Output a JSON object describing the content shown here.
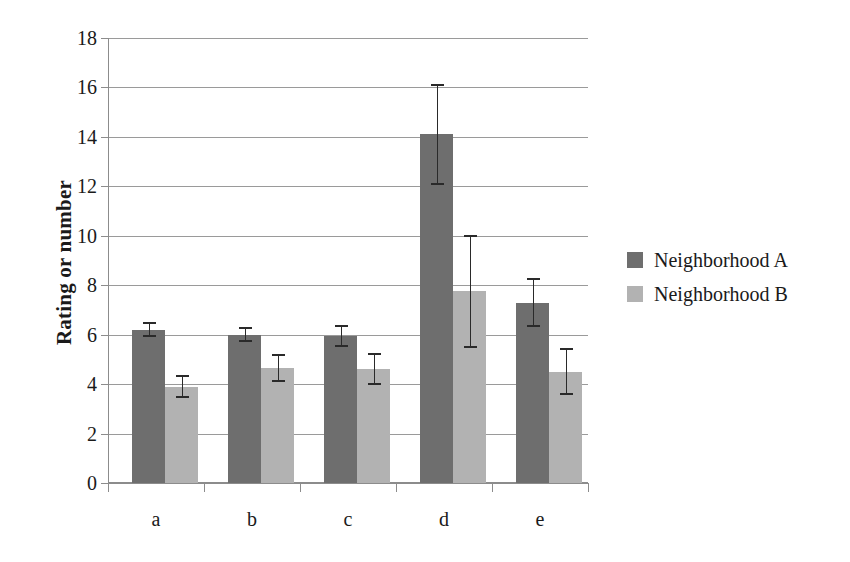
{
  "chart_data": {
    "type": "bar",
    "title": "",
    "xlabel": "",
    "ylabel": "Rating or number",
    "categories": [
      "a",
      "b",
      "c",
      "d",
      "e"
    ],
    "ylim": [
      0,
      18
    ],
    "yticks": [
      0,
      2,
      4,
      6,
      8,
      10,
      12,
      14,
      16,
      18
    ],
    "grid": true,
    "legend_position": "right",
    "errorbars": true,
    "series": [
      {
        "name": "Neighborhood A",
        "color": "#6e6e6e",
        "values": [
          6.2,
          6.0,
          5.95,
          14.1,
          7.3
        ],
        "errors": [
          0.3,
          0.3,
          0.45,
          2.05,
          1.0
        ]
      },
      {
        "name": "Neighborhood B",
        "color": "#b2b2b2",
        "values": [
          3.9,
          4.65,
          4.6,
          7.75,
          4.5
        ],
        "errors": [
          0.45,
          0.55,
          0.65,
          2.3,
          0.95
        ]
      }
    ]
  },
  "axis": {
    "y_title": "Rating or number",
    "y_tick_labels": [
      "0",
      "2",
      "4",
      "6",
      "8",
      "10",
      "12",
      "14",
      "16",
      "18"
    ],
    "x_tick_labels": [
      "a",
      "b",
      "c",
      "d",
      "e"
    ]
  },
  "legend": {
    "entries": [
      {
        "label": "Neighborhood A",
        "swatch": "series-a"
      },
      {
        "label": "Neighborhood B",
        "swatch": "series-b"
      }
    ]
  }
}
